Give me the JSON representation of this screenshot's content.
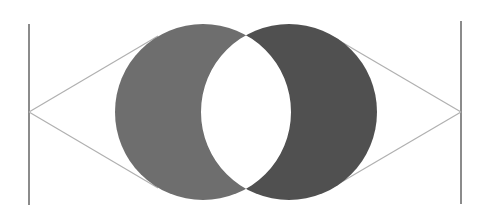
{
  "diagram": {
    "colors": {
      "background": "#ffffff",
      "left_crescent": "#6e6e6e",
      "right_crescent": "#505050",
      "tangent_lines": "#b0b0b0",
      "vertical_lines": "#5a5a5a"
    },
    "left_circle": {
      "cx": 203,
      "cy": 112,
      "r": 88
    },
    "right_circle": {
      "cx": 289,
      "cy": 112,
      "r": 88
    },
    "left_vertical_line": {
      "x": 29,
      "y1": 24,
      "y2": 205
    },
    "right_vertical_line": {
      "x": 461,
      "y1": 21,
      "y2": 204
    },
    "left_apex": {
      "x": 29,
      "y": 112
    },
    "right_apex": {
      "x": 461,
      "y": 112
    },
    "left_tangent_points": [
      {
        "x": 158,
        "y": 36
      },
      {
        "x": 158,
        "y": 188
      }
    ],
    "right_tangent_points": [
      {
        "x": 333,
        "y": 37
      },
      {
        "x": 333,
        "y": 187
      }
    ]
  }
}
